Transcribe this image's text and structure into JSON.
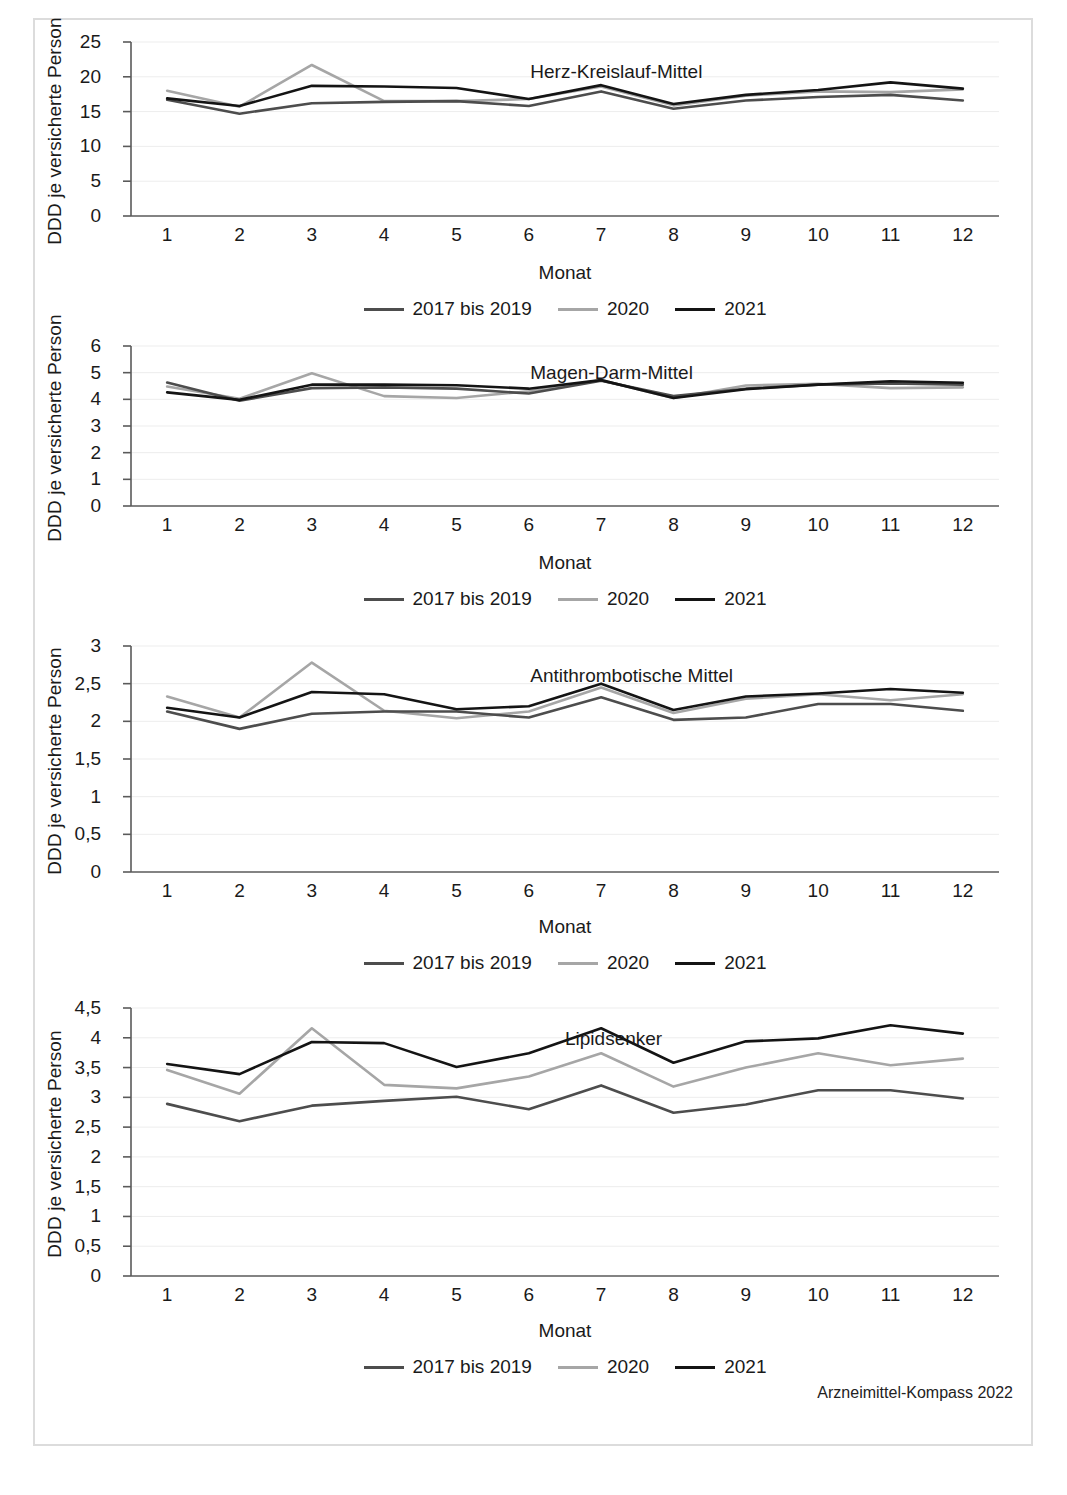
{
  "footer": {
    "source_note": "Arzneimittel-Kompass 2022"
  },
  "legend": {
    "series": [
      {
        "label": "2017 bis 2019",
        "color": "#4d4d4d"
      },
      {
        "label": "2020",
        "color": "#a6a6a6"
      },
      {
        "label": "2021",
        "color": "#141414"
      }
    ]
  },
  "axis": {
    "ylabel": "DDD je versicherte Person",
    "xlabel": "Monat"
  },
  "chart_data": [
    {
      "type": "line",
      "title": "Herz-Kreislauf-Mittel",
      "xlabel": "Monat",
      "ylabel": "DDD je versicherte Person",
      "categories": [
        "1",
        "2",
        "3",
        "4",
        "5",
        "6",
        "7",
        "8",
        "9",
        "10",
        "11",
        "12"
      ],
      "ylim": [
        0,
        25
      ],
      "yticks": [
        0,
        5,
        10,
        15,
        20,
        25
      ],
      "ytick_labels": [
        "0",
        "5",
        "10",
        "15",
        "20",
        "25"
      ],
      "grid": true,
      "legend_position": "bottom",
      "series": [
        {
          "name": "2017 bis 2019",
          "color": "#4d4d4d",
          "values": [
            16.7,
            14.7,
            16.2,
            16.4,
            16.5,
            15.8,
            17.9,
            15.4,
            16.6,
            17.1,
            17.4,
            16.6
          ]
        },
        {
          "name": "2020",
          "color": "#a6a6a6",
          "values": [
            18.0,
            15.7,
            21.7,
            16.5,
            16.5,
            16.8,
            18.6,
            15.9,
            17.3,
            17.9,
            17.8,
            18.2
          ]
        },
        {
          "name": "2021",
          "color": "#141414",
          "values": [
            16.9,
            15.8,
            18.7,
            18.6,
            18.4,
            16.8,
            18.8,
            16.1,
            17.4,
            18.1,
            19.2,
            18.3
          ]
        }
      ]
    },
    {
      "type": "line",
      "title": "Magen-Darm-Mittel",
      "xlabel": "Monat",
      "ylabel": "DDD je versicherte Person",
      "categories": [
        "1",
        "2",
        "3",
        "4",
        "5",
        "6",
        "7",
        "8",
        "9",
        "10",
        "11",
        "12"
      ],
      "ylim": [
        0,
        6
      ],
      "yticks": [
        0,
        1,
        2,
        3,
        4,
        5,
        6
      ],
      "ytick_labels": [
        "0",
        "1",
        "2",
        "3",
        "4",
        "5",
        "6"
      ],
      "grid": true,
      "legend_position": "bottom",
      "series": [
        {
          "name": "2017 bis 2019",
          "color": "#4d4d4d",
          "values": [
            4.63,
            3.95,
            4.42,
            4.45,
            4.4,
            4.22,
            4.7,
            4.12,
            4.4,
            4.55,
            4.6,
            4.55
          ]
        },
        {
          "name": "2020",
          "color": "#a6a6a6",
          "values": [
            4.48,
            4.02,
            4.98,
            4.12,
            4.05,
            4.3,
            4.72,
            4.05,
            4.52,
            4.58,
            4.42,
            4.45
          ]
        },
        {
          "name": "2021",
          "color": "#141414",
          "values": [
            4.26,
            3.98,
            4.55,
            4.55,
            4.53,
            4.4,
            4.72,
            4.05,
            4.38,
            4.55,
            4.68,
            4.62
          ]
        }
      ]
    },
    {
      "type": "line",
      "title": "Antithrombotische Mittel",
      "xlabel": "Monat",
      "ylabel": "DDD je versicherte Person",
      "categories": [
        "1",
        "2",
        "3",
        "4",
        "5",
        "6",
        "7",
        "8",
        "9",
        "10",
        "11",
        "12"
      ],
      "ylim": [
        0,
        3
      ],
      "yticks": [
        0,
        0.5,
        1,
        1.5,
        2,
        2.5,
        3
      ],
      "ytick_labels": [
        "0",
        "0,5",
        "1",
        "1,5",
        "2",
        "2,5",
        "3"
      ],
      "grid": true,
      "legend_position": "bottom",
      "series": [
        {
          "name": "2017 bis 2019",
          "color": "#4d4d4d",
          "values": [
            2.13,
            1.9,
            2.1,
            2.13,
            2.13,
            2.05,
            2.32,
            2.02,
            2.05,
            2.23,
            2.23,
            2.14
          ]
        },
        {
          "name": "2020",
          "color": "#a6a6a6",
          "values": [
            2.33,
            2.05,
            2.78,
            2.14,
            2.04,
            2.13,
            2.45,
            2.11,
            2.3,
            2.36,
            2.28,
            2.36
          ]
        },
        {
          "name": "2021",
          "color": "#141414",
          "values": [
            2.18,
            2.05,
            2.39,
            2.36,
            2.16,
            2.2,
            2.5,
            2.15,
            2.33,
            2.37,
            2.43,
            2.38
          ]
        }
      ]
    },
    {
      "type": "line",
      "title": "Lipidsenker",
      "xlabel": "Monat",
      "ylabel": "DDD je versicherte Person",
      "categories": [
        "1",
        "2",
        "3",
        "4",
        "5",
        "6",
        "7",
        "8",
        "9",
        "10",
        "11",
        "12"
      ],
      "ylim": [
        0,
        4.5
      ],
      "yticks": [
        0,
        0.5,
        1,
        1.5,
        2,
        2.5,
        3,
        3.5,
        4,
        4.5
      ],
      "ytick_labels": [
        "0",
        "0,5",
        "1",
        "1,5",
        "2",
        "2,5",
        "3",
        "3,5",
        "4",
        "4,5"
      ],
      "grid": true,
      "legend_position": "bottom",
      "series": [
        {
          "name": "2017 bis 2019",
          "color": "#4d4d4d",
          "values": [
            2.89,
            2.6,
            2.86,
            2.94,
            3.01,
            2.8,
            3.2,
            2.74,
            2.88,
            3.12,
            3.12,
            2.98
          ]
        },
        {
          "name": "2020",
          "color": "#a6a6a6",
          "values": [
            3.46,
            3.06,
            4.16,
            3.21,
            3.15,
            3.35,
            3.74,
            3.18,
            3.5,
            3.74,
            3.54,
            3.65
          ]
        },
        {
          "name": "2021",
          "color": "#141414",
          "values": [
            3.56,
            3.39,
            3.93,
            3.91,
            3.51,
            3.74,
            4.16,
            3.58,
            3.94,
            3.99,
            4.21,
            4.07
          ]
        }
      ]
    }
  ]
}
